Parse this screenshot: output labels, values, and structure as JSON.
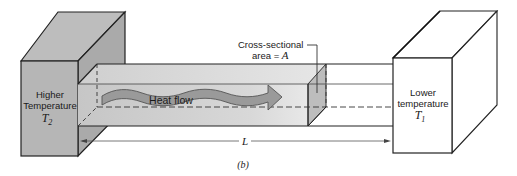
{
  "diagram": {
    "type": "heat-conduction-schematic",
    "caption": "(b)",
    "left_block": {
      "line1": "Higher",
      "line2": "Temperature",
      "symbol": "T",
      "subscript": "2",
      "fill": "#b4b4b4"
    },
    "right_block": {
      "line1": "Lower",
      "line2": "temperature",
      "symbol": "T",
      "subscript": "1",
      "fill": "#ffffff"
    },
    "bar": {
      "arrow_label": "Heat flow",
      "cross_section_line1": "Cross-sectional",
      "cross_section_line2": "area = ",
      "cross_section_symbol": "A",
      "length_symbol": "L",
      "bar_fill": "#d2d2d2",
      "arrow_fill": "#9a9a9a"
    },
    "colors": {
      "stroke": "#222222",
      "block_dark": "#a8a8a8",
      "block_mid": "#b7b7b7",
      "block_light": "#c4c4c4",
      "section_face": "#bdbdbd"
    }
  }
}
